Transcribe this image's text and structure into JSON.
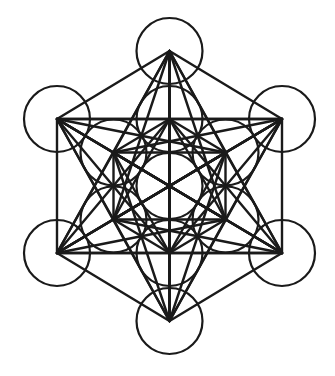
{
  "diagram": {
    "stroke_color": "#1a1a1a",
    "background": "#ffffff",
    "circle_radius": 33,
    "nodes": [
      {
        "id": "center",
        "x": 169.5,
        "y": 186
      },
      {
        "id": "inner-top",
        "x": 169.5,
        "y": 119
      },
      {
        "id": "inner-upper-right",
        "x": 225.5,
        "y": 152.5
      },
      {
        "id": "inner-lower-right",
        "x": 225.5,
        "y": 219.5
      },
      {
        "id": "inner-bottom",
        "x": 169.5,
        "y": 253
      },
      {
        "id": "inner-lower-left",
        "x": 113.5,
        "y": 219.5
      },
      {
        "id": "inner-upper-left",
        "x": 113.5,
        "y": 152.5
      },
      {
        "id": "outer-top",
        "x": 169.5,
        "y": 51
      },
      {
        "id": "outer-upper-right",
        "x": 282,
        "y": 119
      },
      {
        "id": "outer-lower-right",
        "x": 282,
        "y": 253
      },
      {
        "id": "outer-bottom",
        "x": 169.5,
        "y": 321
      },
      {
        "id": "outer-lower-left",
        "x": 57,
        "y": 253
      },
      {
        "id": "outer-upper-left",
        "x": 57,
        "y": 119
      }
    ],
    "connect_all": true
  }
}
